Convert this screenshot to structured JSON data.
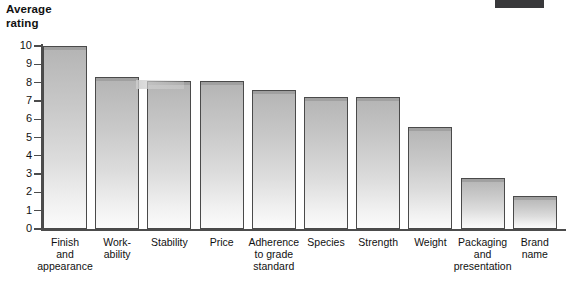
{
  "chart_data": {
    "type": "bar",
    "title": "Average\nrating",
    "ylabel": "Average rating",
    "xlabel": "",
    "ylim": [
      0,
      10
    ],
    "grid": false,
    "legend": null,
    "y_ticks": [
      "10",
      "9",
      "8",
      "7",
      "6",
      "5",
      "4",
      "3",
      "2",
      "1",
      "0"
    ],
    "categories": [
      "Finish\nand\nappearance",
      "Work-\nability",
      "Stability",
      "Price",
      "Adherence\nto grade\nstandard",
      "Species",
      "Strength",
      "Weight",
      "Packaging\nand\npresentation",
      "Brand\nname"
    ],
    "values": [
      10.0,
      8.3,
      8.1,
      8.1,
      7.6,
      7.2,
      7.2,
      5.6,
      2.8,
      1.8
    ]
  },
  "style": {
    "bar_fill_top": "#b4b4b4",
    "bar_fill_bottom": "#fbfbfb",
    "bar_border": "#4a4a4a",
    "axis_color": "#4c4c4c",
    "text_color": "#111111",
    "background": "#ffffff",
    "artifact_color": "#39393b"
  }
}
